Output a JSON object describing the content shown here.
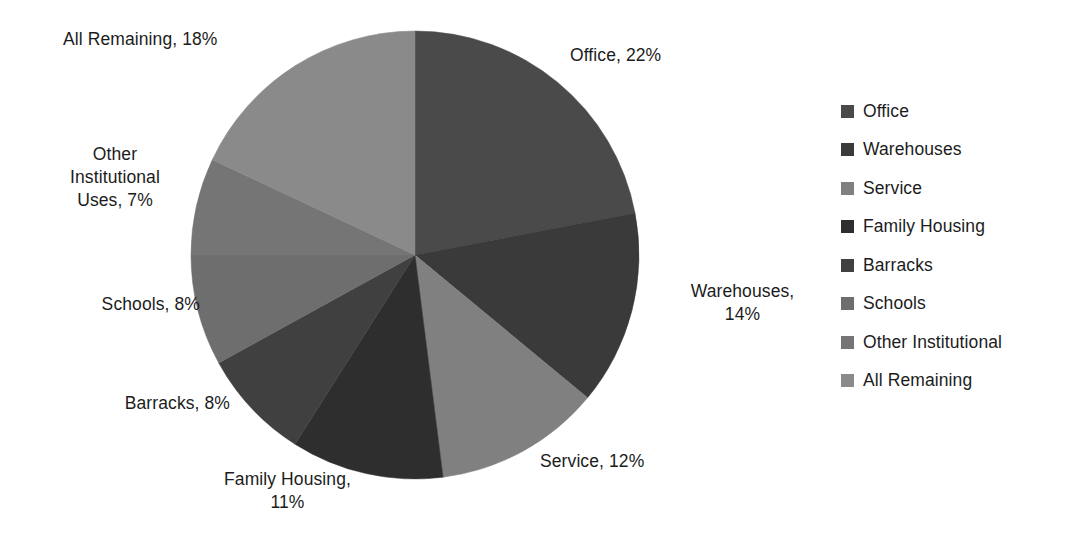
{
  "chart_data": {
    "type": "pie",
    "title": "",
    "subtitle": "",
    "xlabel": "",
    "ylabel": "",
    "grid": false,
    "legend_position": "right",
    "units": "percent",
    "start_angle_deg": 0,
    "direction": "clockwise",
    "categories": [
      "Office",
      "Warehouses",
      "Service",
      "Family Housing",
      "Barracks",
      "Schools",
      "Other Institutional",
      "All Remaining"
    ],
    "values": [
      22,
      14,
      12,
      11,
      8,
      8,
      7,
      18
    ],
    "colors": [
      "#4a4a4a",
      "#3a3a3a",
      "#808080",
      "#2e2e2e",
      "#404040",
      "#6e6e6e",
      "#757575",
      "#8a8a8a"
    ],
    "slices": [
      {
        "label": "Office",
        "value": 22,
        "color": "#4a4a4a",
        "data_label": "Office, 22%"
      },
      {
        "label": "Warehouses",
        "value": 14,
        "color": "#3a3a3a",
        "data_label": "Warehouses, 14%"
      },
      {
        "label": "Service",
        "value": 12,
        "color": "#808080",
        "data_label": "Service, 12%"
      },
      {
        "label": "Family Housing",
        "value": 11,
        "color": "#2e2e2e",
        "data_label": "Family Housing, 11%"
      },
      {
        "label": "Barracks",
        "value": 8,
        "color": "#404040",
        "data_label": "Barracks, 8%"
      },
      {
        "label": "Schools",
        "value": 8,
        "color": "#6e6e6e",
        "data_label": "Schools, 8%"
      },
      {
        "label": "Other Institutional",
        "value": 7,
        "color": "#757575",
        "data_label": "Other Institutional Uses, 7%"
      },
      {
        "label": "All Remaining",
        "value": 18,
        "color": "#8a8a8a",
        "data_label": "All Remaining, 18%"
      }
    ]
  },
  "callouts": {
    "office": "Office, 22%",
    "warehouses": "Warehouses,\n14%",
    "service": "Service, 12%",
    "family_housing": "Family Housing,\n11%",
    "barracks": "Barracks, 8%",
    "schools": "Schools, 8%",
    "other_institutional": "Other\nInstitutional\nUses, 7%",
    "all_remaining": "All Remaining, 18%"
  },
  "legend": {
    "items": [
      {
        "label": "Office",
        "color": "#4a4a4a"
      },
      {
        "label": "Warehouses",
        "color": "#3a3a3a"
      },
      {
        "label": "Service",
        "color": "#808080"
      },
      {
        "label": "Family Housing",
        "color": "#2e2e2e"
      },
      {
        "label": "Barracks",
        "color": "#404040"
      },
      {
        "label": "Schools",
        "color": "#6e6e6e"
      },
      {
        "label": "Other Institutional",
        "color": "#757575"
      },
      {
        "label": "All Remaining",
        "color": "#8a8a8a"
      }
    ]
  }
}
